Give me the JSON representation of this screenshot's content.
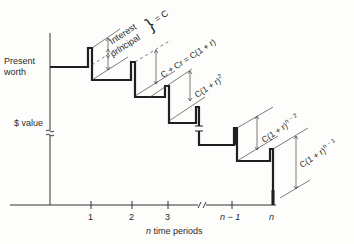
{
  "diagram": {
    "type": "present-worth staircase",
    "y_axis": {
      "labels": [
        "Present",
        "worth",
        "$ value"
      ]
    },
    "x_axis": {
      "title_var": "n",
      "title_rest": " time periods",
      "ticks": [
        "1",
        "2",
        "3",
        "n − 1",
        "n"
      ]
    },
    "annotations": {
      "first_line1": "Interest",
      "first_line2": "principal",
      "first_eq": "= C",
      "second": "C + Cr = C(1 + r)",
      "third_base": "C(1 + r)",
      "third_exp": "2",
      "fourth_base": "C(1 + r)",
      "fourth_exp": "n − 2",
      "fifth_base": "C(1 + r)",
      "fifth_exp": "n − 1"
    },
    "colors": {
      "line": "#1f1f1f",
      "text": "#2a2a2a",
      "background": "#fdfdfb"
    }
  }
}
